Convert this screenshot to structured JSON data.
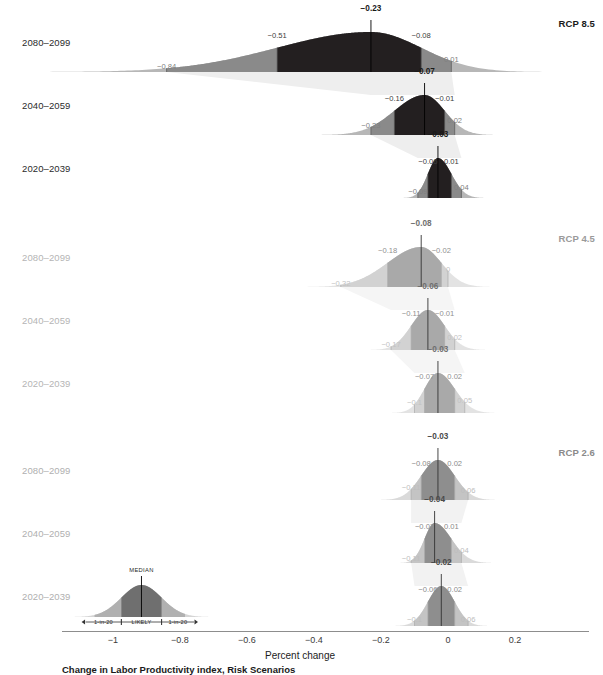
{
  "figure": {
    "x_axis": {
      "label": "Percent change",
      "ticks": [
        "−1",
        "−0.8",
        "−0.6",
        "−0.4",
        "−0.2",
        "0",
        "0.2"
      ],
      "tick_values": [
        -1,
        -0.8,
        -0.6,
        -0.4,
        -0.2,
        0,
        0.2
      ],
      "range": [
        -1.12,
        0.27
      ]
    },
    "legend": {
      "median_label": "MEDIAN",
      "likely_label": "LIKELY",
      "low_tail_label": "1-in-20",
      "high_tail_label": "1-in-20"
    },
    "caption": "Change in Labor Productivity index, Risk Scenarios",
    "colors": {
      "rcp85_likely": "#231f20",
      "rcp85_tail": "#8a8a8a",
      "rcp45_likely": "#a9a9a9",
      "rcp45_tail": "#d2d2d2",
      "rcp26_likely": "#8e8e8e",
      "rcp26_tail": "#c4c4c4",
      "axis": "#8d8d8d",
      "label_dark": "#1a1a1a",
      "label_mid": "#555555",
      "label_light": "#9a9a9a",
      "label_faint": "#bdbdbd"
    }
  },
  "chart_data": {
    "type": "area",
    "title": "Change in Labor Productivity index, Risk Scenarios",
    "xlabel": "Percent change",
    "ylabel": "",
    "xlim": [
      -1.12,
      0.27
    ],
    "grid": false,
    "legend_position": "bottom-left",
    "panels": [
      {
        "name": "RCP 8.5",
        "label_color": "#1a1a1a",
        "periods": [
          {
            "period": "2080–2099",
            "median": -0.23,
            "likely_low": -0.51,
            "likely_high": -0.08,
            "tail_low": -0.84,
            "tail_high": 0.01,
            "labels": [
              "−0.84",
              "−0.51",
              "−0.23",
              "−0.08",
              "0.01"
            ]
          },
          {
            "period": "2040–2059",
            "median": -0.07,
            "likely_low": -0.16,
            "likely_high": -0.01,
            "tail_low": -0.23,
            "tail_high": 0.02,
            "labels": [
              "−0.23",
              "−0.16",
              "−0.07",
              "−0.01",
              "0.02"
            ]
          },
          {
            "period": "2020–2039",
            "median": -0.03,
            "likely_low": -0.06,
            "likely_high": 0.01,
            "tail_low": -0.09,
            "tail_high": 0.04,
            "labels": [
              "−0.09",
              "−0.06",
              "−0.03",
              "0.01",
              "0.04"
            ]
          }
        ]
      },
      {
        "name": "RCP 4.5",
        "label_color": "#9a9a9a",
        "periods": [
          {
            "period": "2080–2099",
            "median": -0.08,
            "likely_low": -0.18,
            "likely_high": -0.02,
            "tail_low": -0.32,
            "tail_high": 0,
            "labels": [
              "−0.32",
              "−0.18",
              "−0.08",
              "−0.02",
              "0"
            ]
          },
          {
            "period": "2040–2059",
            "median": -0.06,
            "likely_low": -0.11,
            "likely_high": -0.01,
            "tail_low": -0.17,
            "tail_high": 0.02,
            "labels": [
              "−0.17",
              "−0.11",
              "−0.06",
              "−0.01",
              "0.02"
            ]
          },
          {
            "period": "2020–2039",
            "median": -0.03,
            "likely_low": -0.07,
            "likely_high": 0.02,
            "tail_low": -0.1,
            "tail_high": 0.05,
            "labels": [
              "−0.1",
              "−0.07",
              "−0.03",
              "0.02",
              "0.05"
            ]
          }
        ]
      },
      {
        "name": "RCP 2.6",
        "label_color": "#8a8a8a",
        "periods": [
          {
            "period": "2080–2099",
            "median": -0.03,
            "likely_low": -0.08,
            "likely_high": 0.02,
            "tail_low": -0.11,
            "tail_high": 0.06,
            "labels": [
              "−0.11",
              "−0.08",
              "−0.03",
              "0.02",
              "0.06"
            ]
          },
          {
            "period": "2040–2059",
            "median": -0.04,
            "likely_low": -0.07,
            "likely_high": 0.01,
            "tail_low": -0.11,
            "tail_high": 0.04,
            "labels": [
              "−0.11",
              "−0.07",
              "−0.04",
              "0.01",
              "0.04"
            ]
          },
          {
            "period": "2020–2039",
            "median": -0.02,
            "likely_low": -0.06,
            "likely_high": 0.02,
            "tail_low": -0.1,
            "tail_high": 0.06,
            "labels": [
              "−0.1",
              "−0.06",
              "−0.02",
              "0.02",
              "0.06"
            ]
          }
        ]
      }
    ],
    "legend_example": {
      "median": -0.915,
      "likely_low": -0.975,
      "likely_high": -0.855,
      "tail_low": -1.055,
      "tail_high": -0.785
    }
  }
}
